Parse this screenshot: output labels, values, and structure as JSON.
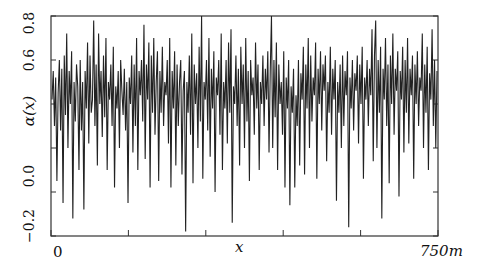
{
  "chart_data": {
    "type": "line",
    "title": "",
    "xlabel": "x",
    "ylabel": "α(x)",
    "xlim": [
      0,
      750
    ],
    "ylim": [
      -0.2,
      0.8
    ],
    "x_unit": "m",
    "x_tick_labels": [
      "0",
      "750m"
    ],
    "x_tick_positions": [
      0,
      150,
      300,
      450,
      600,
      750
    ],
    "y_tick_labels": [
      "−0.2",
      "0.0",
      "0.6",
      "0.8"
    ],
    "y_tick_positions": [
      -0.2,
      0.0,
      0.2,
      0.4,
      0.6,
      0.8
    ],
    "grid": false,
    "legend": null,
    "series": [
      {
        "name": "α(x)",
        "color": "#222222",
        "values": [
          0.42,
          0.55,
          0.3,
          0.52,
          0.05,
          0.45,
          0.6,
          0.28,
          0.56,
          -0.05,
          0.62,
          0.35,
          0.72,
          0.2,
          0.55,
          0.4,
          0.64,
          -0.12,
          0.5,
          0.32,
          0.58,
          0.48,
          0.1,
          0.6,
          0.28,
          0.5,
          -0.08,
          0.55,
          0.38,
          0.68,
          0.22,
          0.62,
          0.36,
          0.42,
          0.78,
          0.3,
          0.58,
          0.12,
          0.72,
          0.4,
          0.55,
          0.25,
          0.62,
          0.34,
          0.7,
          0.1,
          0.5,
          0.42,
          0.58,
          0.3,
          0.66,
          0.02,
          0.48,
          0.38,
          0.55,
          0.2,
          0.6,
          0.46,
          0.35,
          0.56,
          0.28,
          0.5,
          -0.05,
          0.52,
          0.4,
          0.62,
          0.18,
          0.58,
          0.3,
          0.7,
          0.1,
          0.55,
          0.44,
          0.6,
          0.32,
          0.76,
          0.15,
          0.58,
          0.42,
          0.68,
          0.02,
          0.62,
          0.36,
          0.7,
          0.26,
          0.5,
          0.64,
          0.05,
          0.55,
          0.36,
          0.66,
          0.3,
          0.5,
          0.44,
          0.6,
          0.22,
          0.7,
          0.02,
          0.55,
          0.38,
          0.64,
          0.12,
          0.58,
          0.3,
          0.5,
          0.6,
          0.08,
          0.46,
          0.55,
          -0.18,
          0.5,
          0.36,
          0.62,
          0.26,
          0.72,
          0.04,
          0.58,
          0.4,
          0.54,
          0.2,
          0.66,
          0.32,
          0.8,
          0.06,
          0.5,
          0.42,
          0.6,
          0.28,
          0.7,
          0.16,
          0.56,
          0.38,
          0.64,
          0.0,
          0.52,
          0.44,
          0.6,
          0.26,
          0.72,
          0.1,
          0.5,
          0.38,
          0.6,
          0.22,
          0.68,
          0.36,
          0.74,
          -0.14,
          0.48,
          0.4,
          0.62,
          0.3,
          0.56,
          0.12,
          0.66,
          0.4,
          0.58,
          0.2,
          0.7,
          0.32,
          0.55,
          0.05,
          0.6,
          0.44,
          0.52,
          0.26,
          0.68,
          0.38,
          0.58,
          0.1,
          0.5,
          0.4,
          0.62,
          0.3,
          0.56,
          0.42,
          0.64,
          0.18,
          0.55,
          0.8,
          0.2,
          0.6,
          0.34,
          0.68,
          0.1,
          0.58,
          0.4,
          0.5,
          0.26,
          0.64,
          0.02,
          0.52,
          0.38,
          0.6,
          -0.06,
          0.48,
          0.36,
          0.56,
          0.02,
          0.44,
          0.3,
          0.6,
          0.12,
          0.54,
          0.42,
          0.66,
          0.08,
          0.58,
          0.38,
          0.7,
          0.2,
          0.62,
          0.32,
          0.52,
          0.44,
          0.68,
          0.06,
          0.56,
          0.4,
          0.64,
          0.28,
          0.58,
          0.46,
          0.62,
          0.14,
          0.5,
          0.36,
          0.66,
          0.26,
          0.56,
          0.42,
          0.6,
          -0.04,
          0.5,
          0.36,
          0.58,
          0.2,
          0.62,
          0.3,
          0.55,
          0.44,
          0.64,
          -0.16,
          0.52,
          0.38,
          0.6,
          0.28,
          0.54,
          0.46,
          0.62,
          0.22,
          0.58,
          0.4,
          0.66,
          0.06,
          0.52,
          0.42,
          0.6,
          0.3,
          0.56,
          0.44,
          0.74,
          0.14,
          0.62,
          0.78,
          0.2,
          0.6,
          0.36,
          0.66,
          -0.12,
          0.56,
          0.42,
          0.7,
          0.3,
          0.58,
          0.04,
          0.62,
          0.4,
          0.72,
          0.26,
          0.56,
          0.46,
          0.64,
          -0.02,
          0.55,
          0.42,
          0.66,
          0.18,
          0.6,
          0.36,
          0.7,
          0.22,
          0.56,
          0.44,
          0.62,
          0.06,
          0.58,
          0.4,
          0.64,
          0.3,
          0.52,
          0.46,
          0.72,
          0.2,
          0.58,
          0.36,
          0.66,
          0.1,
          0.54,
          0.42,
          0.74,
          0.3,
          0.6,
          0.2,
          0.55
        ]
      }
    ]
  },
  "axis_labels": {
    "y_title": "α(x)",
    "x_title": "x",
    "x_start": "0",
    "x_end": "750m",
    "y_ticks": [
      "0.8",
      "0.6",
      "0.0",
      "−0.2"
    ]
  }
}
